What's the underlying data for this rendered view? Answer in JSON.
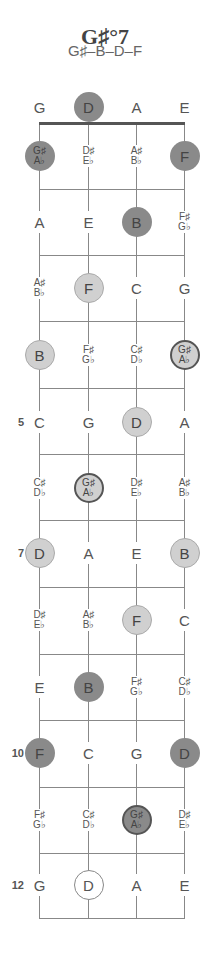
{
  "chart": {
    "title": "G♯°7",
    "notes_formula": "G♯–B–D–F"
  },
  "legend_colors": {
    "dark": "#8a8a8a",
    "light": "#d0d0d0",
    "ring": "#555555",
    "line": "#888888"
  },
  "strings": [
    "G",
    "D",
    "A",
    "E"
  ],
  "fret_markers": [
    {
      "fret": 5,
      "label": "5"
    },
    {
      "fret": 7,
      "label": "7"
    },
    {
      "fret": 10,
      "label": "10"
    },
    {
      "fret": 12,
      "label": "12"
    }
  ],
  "rows": [
    {
      "fret": 0,
      "cells": [
        {
          "top": "G",
          "style": "plain"
        },
        {
          "top": "D",
          "style": "dark"
        },
        {
          "top": "A",
          "style": "plain"
        },
        {
          "top": "E",
          "style": "plain"
        }
      ]
    },
    {
      "fret": 1,
      "cells": [
        {
          "top": "G♯",
          "bottom": "A♭",
          "style": "dark"
        },
        {
          "top": "D♯",
          "bottom": "E♭",
          "style": "plain"
        },
        {
          "top": "A♯",
          "bottom": "B♭",
          "style": "plain"
        },
        {
          "top": "F",
          "style": "dark"
        }
      ]
    },
    {
      "fret": 2,
      "cells": [
        {
          "top": "A",
          "style": "plain"
        },
        {
          "top": "E",
          "style": "plain"
        },
        {
          "top": "B",
          "style": "dark"
        },
        {
          "top": "F♯",
          "bottom": "G♭",
          "style": "plain"
        }
      ]
    },
    {
      "fret": 3,
      "cells": [
        {
          "top": "A♯",
          "bottom": "B♭",
          "style": "plain"
        },
        {
          "top": "F",
          "style": "light"
        },
        {
          "top": "C",
          "style": "plain"
        },
        {
          "top": "G",
          "style": "plain"
        }
      ]
    },
    {
      "fret": 4,
      "cells": [
        {
          "top": "B",
          "style": "light"
        },
        {
          "top": "F♯",
          "bottom": "G♭",
          "style": "plain"
        },
        {
          "top": "C♯",
          "bottom": "D♭",
          "style": "plain"
        },
        {
          "top": "G♯",
          "bottom": "A♭",
          "style": "light-ringed"
        }
      ]
    },
    {
      "fret": 5,
      "cells": [
        {
          "top": "C",
          "style": "plain"
        },
        {
          "top": "G",
          "style": "plain"
        },
        {
          "top": "D",
          "style": "light"
        },
        {
          "top": "A",
          "style": "plain"
        }
      ]
    },
    {
      "fret": 6,
      "cells": [
        {
          "top": "C♯",
          "bottom": "D♭",
          "style": "plain"
        },
        {
          "top": "G♯",
          "bottom": "A♭",
          "style": "light-ringed"
        },
        {
          "top": "D♯",
          "bottom": "E♭",
          "style": "plain"
        },
        {
          "top": "A♯",
          "bottom": "B♭",
          "style": "plain"
        }
      ]
    },
    {
      "fret": 7,
      "cells": [
        {
          "top": "D",
          "style": "light"
        },
        {
          "top": "A",
          "style": "plain"
        },
        {
          "top": "E",
          "style": "plain"
        },
        {
          "top": "B",
          "style": "light"
        }
      ]
    },
    {
      "fret": 8,
      "cells": [
        {
          "top": "D♯",
          "bottom": "E♭",
          "style": "plain"
        },
        {
          "top": "A♯",
          "bottom": "B♭",
          "style": "plain"
        },
        {
          "top": "F",
          "style": "light"
        },
        {
          "top": "C",
          "style": "plain"
        }
      ]
    },
    {
      "fret": 9,
      "cells": [
        {
          "top": "E",
          "style": "plain"
        },
        {
          "top": "B",
          "style": "dark"
        },
        {
          "top": "F♯",
          "bottom": "G♭",
          "style": "plain"
        },
        {
          "top": "C♯",
          "bottom": "D♭",
          "style": "plain"
        }
      ]
    },
    {
      "fret": 10,
      "cells": [
        {
          "top": "F",
          "style": "dark"
        },
        {
          "top": "C",
          "style": "plain"
        },
        {
          "top": "G",
          "style": "plain"
        },
        {
          "top": "D",
          "style": "dark"
        }
      ]
    },
    {
      "fret": 11,
      "cells": [
        {
          "top": "F♯",
          "bottom": "G♭",
          "style": "plain"
        },
        {
          "top": "C♯",
          "bottom": "D♭",
          "style": "plain"
        },
        {
          "top": "G♯",
          "bottom": "A♭",
          "style": "dark-ringed"
        },
        {
          "top": "D♯",
          "bottom": "E♭",
          "style": "plain"
        }
      ]
    },
    {
      "fret": 12,
      "cells": [
        {
          "top": "G",
          "style": "plain"
        },
        {
          "top": "D",
          "style": "outline"
        },
        {
          "top": "A",
          "style": "plain"
        },
        {
          "top": "E",
          "style": "plain"
        }
      ]
    }
  ]
}
